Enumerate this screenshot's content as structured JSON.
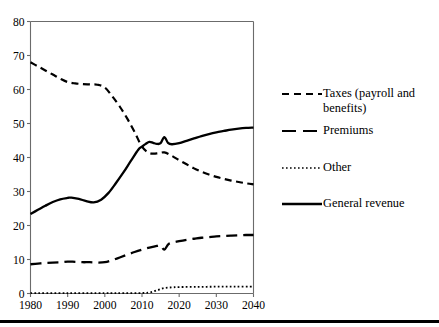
{
  "chart_data": {
    "type": "line",
    "title": "",
    "subtitle": "",
    "xlabel": "",
    "ylabel": "",
    "xlim": [
      1980,
      2040
    ],
    "ylim": [
      0,
      80
    ],
    "xticks": [
      1980,
      1990,
      2000,
      2010,
      2020,
      2030,
      2040
    ],
    "yticks": [
      0,
      10,
      20,
      30,
      40,
      50,
      60,
      70,
      80
    ],
    "xtick_labels": [
      "1980",
      "1990",
      "2000",
      "2010",
      "2020",
      "2030",
      "2040"
    ],
    "ytick_labels": [
      "0",
      "10",
      "20",
      "30",
      "40",
      "50",
      "60",
      "70",
      "80"
    ],
    "grid": false,
    "legend_position": "right",
    "series": [
      {
        "name": "Taxes (payroll and benefits)",
        "style": "dashed",
        "color": "#000000",
        "x": [
          1980,
          1982,
          1984,
          1986,
          1988,
          1990,
          1992,
          1994,
          1996,
          1998,
          2000,
          2002,
          2004,
          2006,
          2008,
          2010,
          2012,
          2014,
          2016,
          2018,
          2020,
          2022,
          2024,
          2026,
          2028,
          2030,
          2032,
          2034,
          2036,
          2038,
          2040
        ],
        "y": [
          68.0,
          66.8,
          65.6,
          64.4,
          63.2,
          62.2,
          61.8,
          61.6,
          61.5,
          61.4,
          60.6,
          58.0,
          55.0,
          51.5,
          47.5,
          43.2,
          41.3,
          41.2,
          41.5,
          40.5,
          39.2,
          38.0,
          36.8,
          35.8,
          35.0,
          34.3,
          33.7,
          33.2,
          32.8,
          32.4,
          32.1
        ]
      },
      {
        "name": "Premiums",
        "style": "long-dashed",
        "color": "#000000",
        "x": [
          1980,
          1982,
          1984,
          1986,
          1988,
          1990,
          1992,
          1994,
          1996,
          1998,
          2000,
          2002,
          2004,
          2006,
          2008,
          2010,
          2012,
          2014,
          2015,
          2016,
          2017,
          2018,
          2020,
          2022,
          2024,
          2026,
          2028,
          2030,
          2032,
          2034,
          2036,
          2038,
          2040
        ],
        "y": [
          8.6,
          8.8,
          9.0,
          9.1,
          9.2,
          9.4,
          9.3,
          9.2,
          9.2,
          9.1,
          9.2,
          9.8,
          10.6,
          11.4,
          12.2,
          12.9,
          13.5,
          14.0,
          14.1,
          12.9,
          14.4,
          14.9,
          15.4,
          15.8,
          16.1,
          16.4,
          16.6,
          16.8,
          16.9,
          17.0,
          17.1,
          17.2,
          17.2
        ]
      },
      {
        "name": "Other",
        "style": "dotted",
        "color": "#000000",
        "x": [
          1980,
          1990,
          2000,
          2005,
          2010,
          2012,
          2014,
          2016,
          2018,
          2020,
          2025,
          2030,
          2035,
          2040
        ],
        "y": [
          0.1,
          0.1,
          0.1,
          0.1,
          0.15,
          0.3,
          0.9,
          1.6,
          1.8,
          1.9,
          1.95,
          2.0,
          2.0,
          2.05
        ]
      },
      {
        "name": "General revenue",
        "style": "solid",
        "color": "#000000",
        "x": [
          1980,
          1982,
          1984,
          1986,
          1988,
          1990,
          1991,
          1993,
          1995,
          1997,
          1999,
          2001,
          2003,
          2005,
          2007,
          2009,
          2010,
          2011,
          2012,
          2013,
          2014,
          2015,
          2016,
          2017,
          2018,
          2020,
          2022,
          2024,
          2026,
          2028,
          2030,
          2032,
          2034,
          2036,
          2038,
          2040
        ],
        "y": [
          23.4,
          24.6,
          25.8,
          26.9,
          27.7,
          28.1,
          28.2,
          27.8,
          27.2,
          26.8,
          27.6,
          29.6,
          32.5,
          35.6,
          39.0,
          42.3,
          43.2,
          44.0,
          44.6,
          44.3,
          44.0,
          44.2,
          46.0,
          44.3,
          43.9,
          44.2,
          44.9,
          45.6,
          46.3,
          46.9,
          47.4,
          47.8,
          48.2,
          48.5,
          48.7,
          48.8
        ]
      }
    ]
  },
  "legend": {
    "items": [
      {
        "label": "Taxes (payroll and\nbenefits)",
        "style": "dashed"
      },
      {
        "label": "Premiums",
        "style": "long-dashed"
      },
      {
        "label": "Other",
        "style": "dotted"
      },
      {
        "label": "General revenue",
        "style": "solid"
      }
    ]
  },
  "axes": {
    "x_tick_labels": [
      "1980",
      "1990",
      "2000",
      "2010",
      "2020",
      "2030",
      "2040"
    ],
    "y_tick_labels": [
      "0",
      "10",
      "20",
      "30",
      "40",
      "50",
      "60",
      "70",
      "80"
    ]
  },
  "colors": {
    "line": "#000000",
    "axis": "#6b6b6b",
    "background": "#ffffff",
    "rule": "#000000"
  }
}
